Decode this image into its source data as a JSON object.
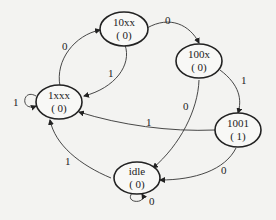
{
  "diagram": {
    "type": "state-machine",
    "states": [
      {
        "id": "s_10xx",
        "name": "10xx",
        "output": "( 0)"
      },
      {
        "id": "s_100x",
        "name": "100x",
        "output": "( 0)"
      },
      {
        "id": "s_1xxx",
        "name": "1xxx",
        "output": "( 0)"
      },
      {
        "id": "s_1001",
        "name": "1001",
        "output": "( 1)"
      },
      {
        "id": "s_idle",
        "name": "idle",
        "output": "( 0)"
      }
    ],
    "transitions": [
      {
        "from": "1xxx",
        "to": "10xx",
        "label": "0"
      },
      {
        "from": "10xx",
        "to": "1xxx",
        "label": "1"
      },
      {
        "from": "10xx",
        "to": "100x",
        "label": "0"
      },
      {
        "from": "100x",
        "to": "1001",
        "label": "1"
      },
      {
        "from": "100x",
        "to": "idle",
        "label": "0"
      },
      {
        "from": "1001",
        "to": "1xxx",
        "label": "1"
      },
      {
        "from": "1001",
        "to": "idle",
        "label": "0"
      },
      {
        "from": "idle",
        "to": "1xxx",
        "label": "1"
      },
      {
        "from": "1xxx",
        "to": "1xxx",
        "label": "1"
      },
      {
        "from": "idle",
        "to": "idle",
        "label": "0"
      }
    ]
  }
}
